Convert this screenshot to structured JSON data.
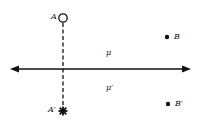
{
  "diagram": {
    "points": {
      "A": {
        "label": "A",
        "marker": "open-circle",
        "x": 63,
        "y": 18
      },
      "A_prime": {
        "label": "A′",
        "marker": "star",
        "x": 63,
        "y": 111
      },
      "B": {
        "label": "B",
        "marker": "filled-dot",
        "x": 167,
        "y": 37
      },
      "B_prime": {
        "label": "B′",
        "marker": "filled-dot",
        "x": 168,
        "y": 104
      }
    },
    "regions": {
      "mu": {
        "label": "μ",
        "x": 108,
        "y": 50
      },
      "mu_prime": {
        "label": "μ′",
        "x": 108,
        "y": 85
      }
    },
    "axis": {
      "type": "double-arrow",
      "y": 69,
      "x_start": 10,
      "x_end": 191
    },
    "connector": {
      "type": "dashed",
      "from": "A",
      "to": "A_prime"
    },
    "colors": {
      "ink": "#111111",
      "background": "#ffffff"
    }
  }
}
